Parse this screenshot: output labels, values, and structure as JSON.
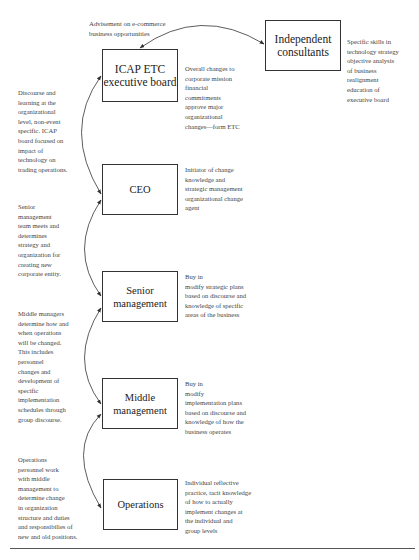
{
  "diagram": {
    "type": "organizational change flow diagram",
    "boxes": [
      {
        "id": "icap",
        "label": "ICAP ETC\nexecutive board"
      },
      {
        "id": "consultants",
        "label": "Independent\nconsultants"
      },
      {
        "id": "ceo",
        "label": "CEO"
      },
      {
        "id": "senior",
        "label": "Senior\nmanagement"
      },
      {
        "id": "middle",
        "label": "Middle\nmanagement"
      },
      {
        "id": "operations",
        "label": "Operations"
      }
    ],
    "top_annotation": "Advisement on e-commerce\nbusiness opportunities",
    "right_notes": {
      "consultants": "Specific skills in\ntechnology strategy\nobjective analysis\nof business\nrealignment\neducation of\nexecutive board",
      "icap": "Overall changes to\ncorporate mission\nfinancial\ncommitments\napprove major\norganizational\nchanges—form ETC",
      "ceo": "Initiator of change\nknowledge and\nstrategic management\norganizational change\nagent",
      "senior": "Buy in\nmodify strategic plans\nbased on discourse and\nknowledge of specific\nareas of the business",
      "middle": "Buy in\nmodify\nimplementation plans\nbased on discourse and\nknowledge of how the\nbusiness operates",
      "operations": "Individual reflective\npractice, tacit knowledge\nof how to actually\nimplement changes at\nthe individual and\ngroup levels"
    },
    "left_notes": {
      "icap_ceo": "Discourse and\nlearning at the\norganizational\nlevel, non-event\nspecific. ICAP\nboard focused on\nimpact of\ntechnology on\ntrading operations.",
      "ceo_senior": "Senior\nmanagement\nteam meets and\ndetermines\nstrategy and\norganization for\ncreating new\ncorporate entity.",
      "senior_middle": "Middle managers\ndetermine how and\nwhen operations\nwill be changed.\nThis includes\npersonnel\nchanges and\ndevelopment of\nspecific\nimplementation\nschedules through\ngroup discourse.",
      "middle_operations": "Operations\npersonnel work\nwith middle\nmanagement to\ndetermine change\nin organization\nstructure and duties\nand responsibilies of\nnew and old positions."
    },
    "colors": {
      "line": "#333333",
      "text": "#444444",
      "background": "#ffffff"
    }
  }
}
